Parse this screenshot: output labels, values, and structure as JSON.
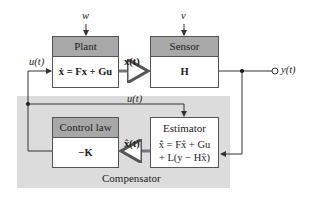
{
  "diagram": {
    "type": "block-diagram",
    "compensator": {
      "label": "Compensator"
    },
    "blocks": {
      "plant": {
        "header": "Plant",
        "equation": "ẋ = Fx + Gu"
      },
      "sensor": {
        "header": "Sensor",
        "equation": "H"
      },
      "control_law": {
        "header": "Control law",
        "equation": "−K"
      },
      "estimator": {
        "header": "Estimator",
        "equation_line1": "x̂̇ = Fx̂ + Gu",
        "equation_line2": "+ L(y − Hx̂)"
      }
    },
    "signals": {
      "process_noise": "w",
      "sensor_noise": "v",
      "input_top": "u(t)",
      "input_compensator": "u(t)",
      "state": "x(t)",
      "state_estimate": "x̂(t)",
      "output": "y(t)"
    },
    "colors": {
      "header_fill": "#a8a8a8",
      "compensator_fill": "#dcdcdc",
      "wire": "#333333",
      "vector_wire": "#777777"
    }
  }
}
